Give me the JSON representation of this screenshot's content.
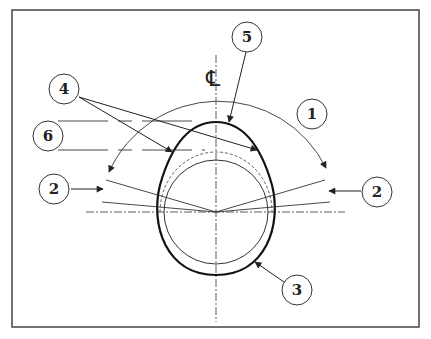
{
  "diagram": {
    "centerline_symbol": "℄",
    "callouts": [
      {
        "id": "1",
        "label": "1",
        "cx": 312,
        "cy": 114
      },
      {
        "id": "2-left",
        "label": "2",
        "cx": 54,
        "cy": 189
      },
      {
        "id": "2-right",
        "label": "2",
        "cx": 377,
        "cy": 192
      },
      {
        "id": "3",
        "label": "3",
        "cx": 297,
        "cy": 290
      },
      {
        "id": "4",
        "label": "4",
        "cx": 64,
        "cy": 89
      },
      {
        "id": "5",
        "label": "5",
        "cx": 247,
        "cy": 37
      },
      {
        "id": "6",
        "label": "6",
        "cx": 48,
        "cy": 136
      }
    ],
    "colors": {
      "line": "#222222",
      "background": "#ffffff",
      "frame": "#444444"
    }
  }
}
